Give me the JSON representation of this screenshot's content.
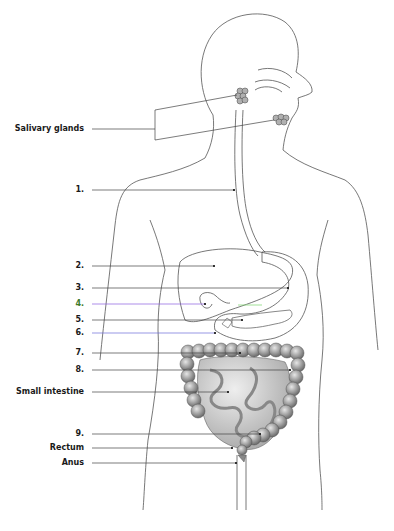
{
  "diagram": {
    "labels": [
      {
        "id": "salivary-glands",
        "text": "Salivary glands",
        "y": 129,
        "right": 84
      },
      {
        "id": "label-1",
        "text": "1.",
        "y": 190,
        "right": 84
      },
      {
        "id": "label-2",
        "text": "2.",
        "y": 266,
        "right": 84
      },
      {
        "id": "label-3",
        "text": "3.",
        "y": 288,
        "right": 84
      },
      {
        "id": "label-4",
        "text": "4.",
        "y": 304,
        "right": 84,
        "color": "#3c7a2a"
      },
      {
        "id": "label-5",
        "text": "5.",
        "y": 320,
        "right": 84
      },
      {
        "id": "label-6",
        "text": "6.",
        "y": 333,
        "right": 84
      },
      {
        "id": "label-7",
        "text": "7.",
        "y": 353,
        "right": 84
      },
      {
        "id": "label-8",
        "text": "8.",
        "y": 370,
        "right": 84
      },
      {
        "id": "small-intestine",
        "text": "Small intestine",
        "y": 392,
        "right": 84
      },
      {
        "id": "label-9",
        "text": "9.",
        "y": 434,
        "right": 84
      },
      {
        "id": "rectum",
        "text": "Rectum",
        "y": 448,
        "right": 84
      },
      {
        "id": "anus",
        "text": "Anus",
        "y": 463,
        "right": 84
      }
    ],
    "colors": {
      "outline": "#555555",
      "leader": "#444444",
      "leader_4": "#8a5be0",
      "leader_4_green": "#7ad46a",
      "leader_6": "#6a6ad8",
      "organ_fill": "#9a9a9a",
      "organ_light": "#c8c8c8",
      "label_4_text": "#3c7a2a"
    }
  }
}
